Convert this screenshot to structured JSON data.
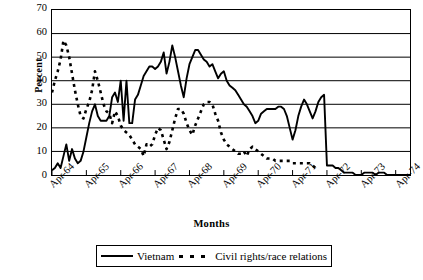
{
  "chart_data": {
    "type": "line",
    "title": "",
    "xlabel": "Months",
    "ylabel": "Percent",
    "ylim": [
      0,
      70
    ],
    "yticks": [
      0,
      10,
      20,
      30,
      40,
      50,
      60,
      70
    ],
    "grid": "horizontal",
    "legend_position": "bottom",
    "x_tick_labels": [
      "Apr-64",
      "Apr-65",
      "Apr-66",
      "Apr-67",
      "Apr-68",
      "Apr-69",
      "Apr-70",
      "Apr-71",
      "Apr-72",
      "Apr-73",
      "Apr-74"
    ],
    "x_tick_step_months": 12,
    "x_start": "Apr-64",
    "x_range_months": 126,
    "series": [
      {
        "name": "Vietnam",
        "style": "solid",
        "color": "#000000",
        "values": [
          2,
          3,
          5,
          3,
          8,
          13,
          6,
          11,
          7,
          5,
          6,
          10,
          16,
          22,
          27,
          30,
          25,
          23,
          23,
          23,
          25,
          33,
          35,
          31,
          40,
          23,
          40,
          22,
          22,
          32,
          34,
          38,
          42,
          44,
          46,
          46,
          45,
          46,
          48,
          52,
          43,
          48,
          55,
          50,
          44,
          38,
          33,
          41,
          47,
          50,
          53,
          53,
          51,
          49,
          48,
          46,
          47,
          44,
          41,
          43,
          44,
          40,
          38,
          37,
          36,
          34,
          32,
          30,
          29,
          27,
          25,
          22,
          23,
          26,
          27,
          28,
          28,
          28,
          28,
          29,
          29,
          28,
          25,
          20,
          15,
          19,
          25,
          29,
          32,
          30,
          27,
          24,
          27,
          31,
          33,
          34,
          4,
          4,
          4,
          3,
          3,
          2,
          1,
          1,
          1,
          1,
          0,
          0,
          0,
          1,
          1,
          1,
          1,
          0,
          1,
          1,
          1,
          0,
          0,
          0,
          0,
          0,
          0,
          0,
          0,
          0
        ]
      },
      {
        "name": "Civil rights/race relations",
        "style": "dashed",
        "color": "#000000",
        "values": [
          35,
          40,
          44,
          49,
          57,
          55,
          50,
          43,
          36,
          30,
          25,
          24,
          28,
          31,
          36,
          44,
          40,
          35,
          30,
          27,
          26,
          22,
          27,
          25,
          21,
          19,
          18,
          17,
          15,
          13,
          12,
          11,
          8,
          13,
          12,
          13,
          17,
          20,
          19,
          15,
          11,
          14,
          19,
          24,
          28,
          28,
          26,
          22,
          19,
          17,
          21,
          24,
          27,
          30,
          31,
          31,
          30,
          26,
          23,
          18,
          15,
          13,
          12,
          11,
          10,
          9,
          9,
          10,
          8,
          11,
          12,
          11,
          10,
          9,
          8,
          7,
          7,
          7,
          6,
          6,
          6,
          6,
          6,
          6,
          5,
          5,
          5,
          5,
          5,
          5,
          5,
          4,
          3,
          2
        ]
      }
    ]
  }
}
